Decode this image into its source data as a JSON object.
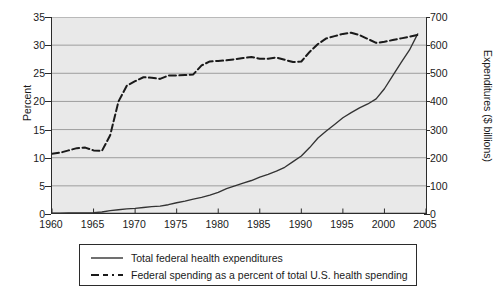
{
  "chart_data": {
    "type": "line",
    "title": "",
    "subtitle": "",
    "xlabel": "",
    "ylabel": "Percent",
    "ylabel_secondary": "Expenditures ($ billions)",
    "xlim": [
      1960,
      2005
    ],
    "ylim": [
      0,
      35
    ],
    "ylim_secondary": [
      0,
      700
    ],
    "grid": true,
    "grid_axis": "y",
    "legend_position": "below-plot",
    "xticks": [
      1960,
      1965,
      1970,
      1975,
      1980,
      1985,
      1990,
      1995,
      2000,
      2005
    ],
    "xtick_labels": [
      "1960",
      "1965",
      "1970",
      "1975",
      "1980",
      "1985",
      "1990",
      "1995",
      "2000",
      "2005"
    ],
    "yticks": [
      0,
      5,
      10,
      15,
      20,
      25,
      30,
      35
    ],
    "ytick_labels": [
      "0",
      "5",
      "10",
      "15",
      "20",
      "25",
      "30",
      "35"
    ],
    "yticks_secondary": [
      0,
      100,
      200,
      300,
      400,
      500,
      600,
      700
    ],
    "ytick_labels_secondary": [
      "0",
      "100",
      "200",
      "300",
      "400",
      "500",
      "600",
      "700"
    ],
    "x": [
      1960,
      1961,
      1962,
      1963,
      1964,
      1965,
      1966,
      1967,
      1968,
      1969,
      1970,
      1971,
      1972,
      1973,
      1974,
      1975,
      1976,
      1977,
      1978,
      1979,
      1980,
      1981,
      1982,
      1983,
      1984,
      1985,
      1986,
      1987,
      1988,
      1989,
      1990,
      1991,
      1992,
      1993,
      1994,
      1995,
      1996,
      1997,
      1998,
      1999,
      2000,
      2001,
      2002,
      2003,
      2004
    ],
    "series": [
      {
        "name": "Total federal health expenditures",
        "axis": "right",
        "unit": "$ billions",
        "style": "solid",
        "color": "#333333",
        "values": [
          3,
          3,
          4,
          4,
          4,
          5,
          7,
          12,
          15,
          18,
          20,
          23,
          26,
          28,
          33,
          40,
          46,
          53,
          59,
          67,
          77,
          90,
          100,
          110,
          119,
          131,
          141,
          152,
          166,
          186,
          206,
          236,
          270,
          295,
          318,
          342,
          360,
          377,
          391,
          409,
          445,
          492,
          538,
          582,
          640
        ]
      },
      {
        "name": "Federal spending as a percent of total U.S. health spending",
        "axis": "left",
        "unit": "percent",
        "style": "dashed",
        "color": "#1a1a1a",
        "values": [
          10.7,
          10.9,
          11.3,
          11.7,
          11.8,
          11.3,
          11.2,
          14.0,
          20.0,
          22.8,
          23.6,
          24.3,
          24.2,
          24.0,
          24.6,
          24.6,
          24.7,
          24.8,
          26.4,
          27.1,
          27.2,
          27.3,
          27.5,
          27.7,
          27.9,
          27.6,
          27.6,
          27.8,
          27.4,
          27.0,
          27.1,
          28.8,
          30.2,
          31.2,
          31.6,
          32.0,
          32.2,
          31.8,
          31.1,
          30.4,
          30.6,
          30.9,
          31.2,
          31.5,
          31.8
        ]
      }
    ],
    "annotations": []
  },
  "axes": {
    "left_title": "Percent",
    "right_title": "Expenditures ($ billions)"
  },
  "legend": {
    "items": [
      {
        "label": "Total federal health expenditures",
        "style": "solid",
        "icon": "solid-line-swatch"
      },
      {
        "label": "Federal spending as a percent of total U.S. health spending",
        "style": "dashed",
        "icon": "dashed-line-swatch"
      }
    ]
  },
  "colors": {
    "plot_background": "#e9e9e9",
    "figure_background": "#ffffff",
    "gridline": "#8a8a8a",
    "axis": "#2b2b2b",
    "series_solid": "#333333",
    "series_dashed": "#1a1a1a",
    "text": "#1a1a1a"
  }
}
